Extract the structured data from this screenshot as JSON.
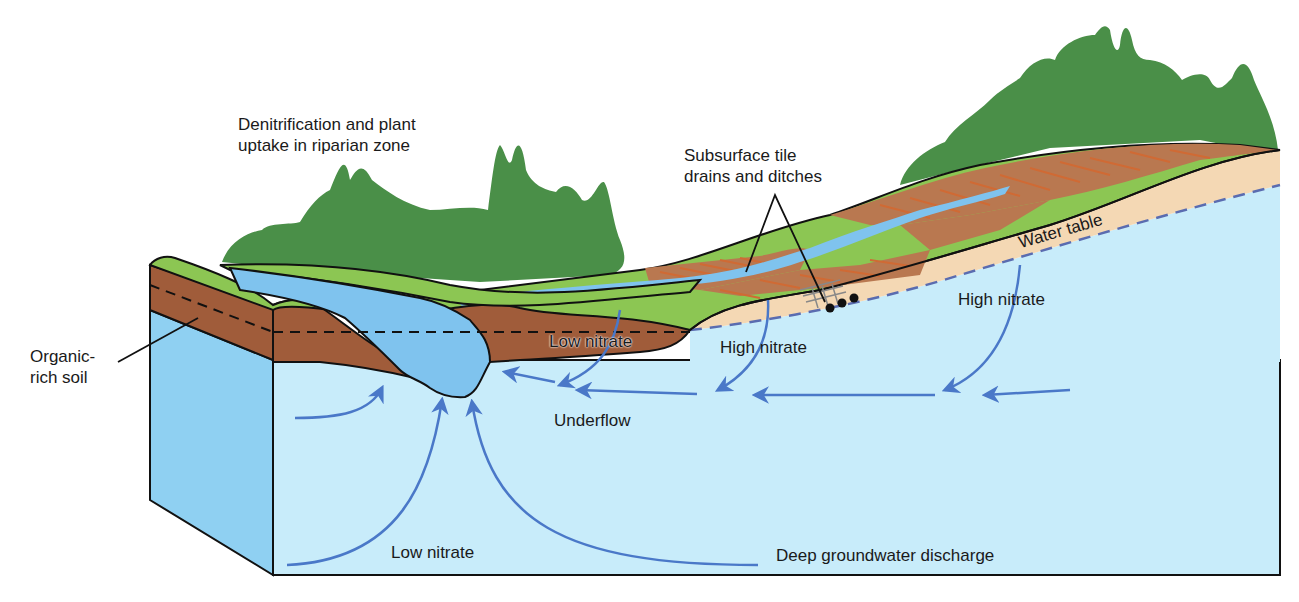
{
  "diagram": {
    "type": "block-diagram cross-section",
    "colors": {
      "trees": "#4a8f48",
      "grass": "#8cc653",
      "cropland": "#b97850",
      "crop_rows": "#d06a34",
      "organic_soil": "#a05c3a",
      "unsaturated_sand": "#f4d8b4",
      "groundwater": "#c8ecfa",
      "groundwater_side": "#8fd0f2",
      "stream_water": "#7fc3ee",
      "flow_arrows": "#4a78c8",
      "water_table_line": "#5a6cb0",
      "outline": "#111111"
    },
    "labels": {
      "riparian": "Denitrification and plant\nuptake in riparian zone",
      "tile_drains": "Subsurface tile\ndrains and ditches",
      "water_table": "Water table",
      "organic_soil": "Organic-\nrich soil",
      "low_nitrate_upper": "Low nitrate",
      "high_nitrate_mid": "High nitrate",
      "high_nitrate_right": "High nitrate",
      "underflow": "Underflow",
      "low_nitrate_lower": "Low nitrate",
      "deep_discharge": "Deep groundwater discharge"
    },
    "elements": [
      {
        "name": "riparian-forest",
        "description": "Trees along stream (left)"
      },
      {
        "name": "upland-forest",
        "description": "Trees on hilltop (right)"
      },
      {
        "name": "stream",
        "description": "Stream channel at left with tributary ditch"
      },
      {
        "name": "agricultural-fields",
        "description": "Plowed fields with crop rows"
      },
      {
        "name": "tile-drains",
        "description": "Three subsurface tile drain pipes"
      },
      {
        "name": "water-table",
        "description": "Dashed line separating unsaturated zone from groundwater"
      },
      {
        "name": "groundwater-flow-arrows",
        "description": "Arrows showing flow toward stream"
      }
    ]
  }
}
